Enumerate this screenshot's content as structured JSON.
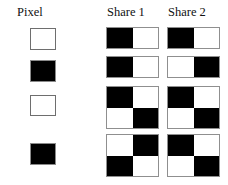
{
  "figure": {
    "columns": [
      {
        "id": "pixel",
        "label": "Pixel"
      },
      {
        "id": "share1",
        "label": "Share 1"
      },
      {
        "id": "share2",
        "label": "Share 2"
      }
    ],
    "colors": {
      "black": "#000000",
      "white": "#ffffff",
      "outline": "#8f8f8f",
      "text": "#111111",
      "background": "#ffffff"
    },
    "rows": [
      {
        "index": 1,
        "pixel": "white",
        "pixel_name": "white-pixel",
        "subpixel_layout": "2x1",
        "share1": [
          "black",
          "white"
        ],
        "share2": [
          "black",
          "white"
        ],
        "stack_result": "white"
      },
      {
        "index": 2,
        "pixel": "black",
        "pixel_name": "black-pixel",
        "subpixel_layout": "2x1",
        "share1": [
          "black",
          "white"
        ],
        "share2": [
          "white",
          "black"
        ],
        "stack_result": "black"
      },
      {
        "index": 3,
        "pixel": "white",
        "pixel_name": "white-pixel",
        "subpixel_layout": "2x2",
        "share1": [
          "black",
          "white",
          "white",
          "black"
        ],
        "share2": [
          "black",
          "white",
          "white",
          "black"
        ],
        "stack_result": "white"
      },
      {
        "index": 4,
        "pixel": "black",
        "pixel_name": "black-pixel",
        "subpixel_layout": "2x2",
        "share1": [
          "white",
          "black",
          "black",
          "white"
        ],
        "share2": [
          "black",
          "white",
          "white",
          "black"
        ],
        "stack_result": "black"
      }
    ]
  }
}
